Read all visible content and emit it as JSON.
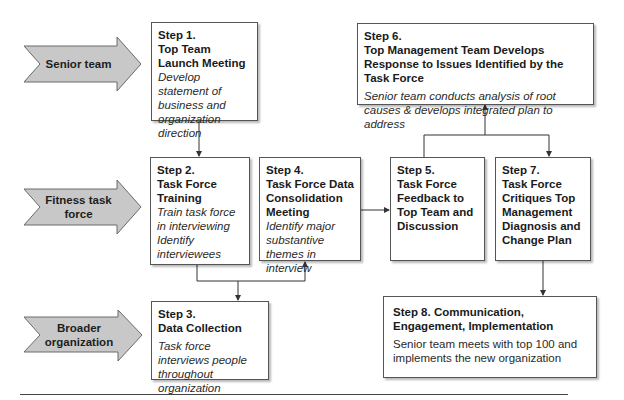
{
  "colors": {
    "arrow_fill": "#c8c8c8",
    "arrow_stroke": "#6a6a6a",
    "box_border": "#555555",
    "connector": "#333333",
    "text": "#1a1a1a"
  },
  "lanes": [
    {
      "id": "senior",
      "label": "Senior team",
      "shape": "chevron-arrow"
    },
    {
      "id": "fitness",
      "label": "Fitness task force",
      "shape": "chevron-arrow"
    },
    {
      "id": "broader",
      "label": "Broader organization",
      "shape": "chevron-arrow"
    }
  ],
  "steps": {
    "s1": {
      "step": "Step 1.",
      "title": "Top Team Launch Meeting",
      "desc": "Develop statement of business and organization direction",
      "lane": "senior"
    },
    "s2": {
      "step": "Step 2.",
      "title": "Task Force Training",
      "desc": "Train task force in interviewing Identify interviewees",
      "lane": "fitness"
    },
    "s3": {
      "step": "Step 3.",
      "title": "Data Collection",
      "desc": "Task force interviews people throughout organization",
      "lane": "broader"
    },
    "s4": {
      "step": "Step 4.",
      "title": "Task Force Data Consolidation Meeting",
      "desc": "Identify major substantive themes in interview",
      "lane": "fitness"
    },
    "s5": {
      "step": "Step 5.",
      "title": "Task Force Feedback to Top Team and Discussion",
      "desc": "",
      "lane": "fitness"
    },
    "s6": {
      "step": "Step 6.",
      "title": "Top Management Team Develops Response to Issues Identified by the Task Force",
      "desc": "Senior team conducts analysis of root causes & develops integrated plan to address",
      "lane": "senior"
    },
    "s7": {
      "step": "Step 7.",
      "title": "Task Force Critiques Top Management Diagnosis and Change Plan",
      "desc": "",
      "lane": "fitness"
    },
    "s8": {
      "step": "Step 8.",
      "title": "Communication, Engagement, Implementation",
      "desc": "Senior team meets with top 100 and implements the new organization",
      "lane": "broader"
    }
  },
  "flow": [
    {
      "from": "s1",
      "to": "s2"
    },
    {
      "from": "s2",
      "to": "s3"
    },
    {
      "from": "s2",
      "to": "s4"
    },
    {
      "from": "s4",
      "to": "s5"
    },
    {
      "from": "s5",
      "to": "s6"
    },
    {
      "from": "s5",
      "to": "s7"
    },
    {
      "from": "s7",
      "to": "s8"
    }
  ]
}
